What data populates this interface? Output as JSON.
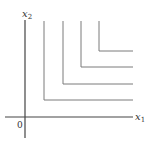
{
  "diagram": {
    "type": "indifference-curves-perfect-complements",
    "axes": {
      "x_label": "x",
      "x_sub": "1",
      "y_label": "x",
      "y_sub": "2",
      "origin_label": "0"
    },
    "colors": {
      "axis": "#444444",
      "curve": "#7a7a7a"
    },
    "curves": [
      {
        "corner_x": 44,
        "corner_y": 100
      },
      {
        "corner_x": 63,
        "corner_y": 84
      },
      {
        "corner_x": 81,
        "corner_y": 67
      },
      {
        "corner_x": 99,
        "corner_y": 51
      }
    ]
  }
}
